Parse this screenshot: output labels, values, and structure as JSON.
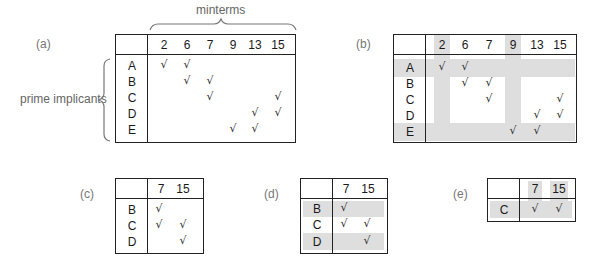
{
  "labels": {
    "minterms": "minterms",
    "prime_implicants": "prime implicants",
    "panel_a": "(a)",
    "panel_b": "(b)",
    "panel_c": "(c)",
    "panel_d": "(d)",
    "panel_e": "(e)"
  },
  "check_mark": "√",
  "colors": {
    "border": "#222222",
    "shade": "#dedede",
    "label": "#777777"
  },
  "table_a": {
    "columns": [
      "2",
      "6",
      "7",
      "9",
      "13",
      "15"
    ],
    "rows": [
      {
        "label": "A",
        "checks": [
          "√",
          "√",
          "",
          "",
          "",
          ""
        ]
      },
      {
        "label": "B",
        "checks": [
          "",
          "√",
          "√",
          "",
          "",
          ""
        ]
      },
      {
        "label": "C",
        "checks": [
          "",
          "",
          "√",
          "",
          "",
          "√"
        ]
      },
      {
        "label": "D",
        "checks": [
          "",
          "",
          "",
          "",
          "√",
          "√"
        ]
      },
      {
        "label": "E",
        "checks": [
          "",
          "",
          "",
          "√",
          "√",
          ""
        ]
      }
    ]
  },
  "table_b": {
    "columns": [
      "2",
      "6",
      "7",
      "9",
      "13",
      "15"
    ],
    "shaded_columns": [
      "2",
      "9"
    ],
    "shaded_rows": [
      "A",
      "E"
    ],
    "rows": [
      {
        "label": "A",
        "checks": [
          "√",
          "√",
          "",
          "",
          "",
          ""
        ]
      },
      {
        "label": "B",
        "checks": [
          "",
          "√",
          "√",
          "",
          "",
          ""
        ]
      },
      {
        "label": "C",
        "checks": [
          "",
          "",
          "√",
          "",
          "",
          "√"
        ]
      },
      {
        "label": "D",
        "checks": [
          "",
          "",
          "",
          "",
          "√",
          "√"
        ]
      },
      {
        "label": "E",
        "checks": [
          "",
          "",
          "",
          "√",
          "√",
          ""
        ]
      }
    ]
  },
  "table_c": {
    "columns": [
      "7",
      "15"
    ],
    "rows": [
      {
        "label": "B",
        "checks": [
          "√",
          ""
        ]
      },
      {
        "label": "C",
        "checks": [
          "√",
          "√"
        ]
      },
      {
        "label": "D",
        "checks": [
          "",
          "√"
        ]
      }
    ]
  },
  "table_d": {
    "columns": [
      "7",
      "15"
    ],
    "shaded_rows": [
      "B",
      "D"
    ],
    "rows": [
      {
        "label": "B",
        "checks": [
          "√",
          ""
        ]
      },
      {
        "label": "C",
        "checks": [
          "√",
          "√"
        ]
      },
      {
        "label": "D",
        "checks": [
          "",
          "√"
        ]
      }
    ]
  },
  "table_e": {
    "columns": [
      "7",
      "15"
    ],
    "shaded_columns": [
      "7",
      "15"
    ],
    "shaded_rows": [
      "C"
    ],
    "rows": [
      {
        "label": "C",
        "checks": [
          "√",
          "√"
        ]
      }
    ]
  }
}
